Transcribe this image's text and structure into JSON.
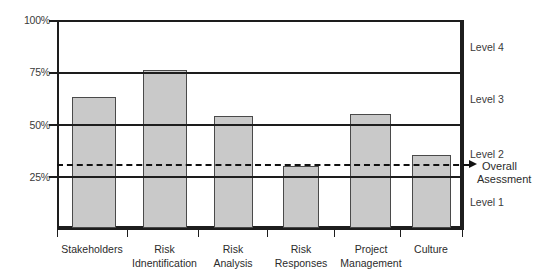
{
  "chart_data": {
    "type": "bar",
    "title": "",
    "subtitle": "",
    "xlabel": "",
    "ylabel": "",
    "ylim": [
      0,
      100
    ],
    "grid": true,
    "legend_position": "right",
    "categories": [
      "Stakeholders",
      "Risk Idnentification",
      "Risk Analysis",
      "Risk Responses",
      "Project Management",
      "Culture"
    ],
    "category_lines": [
      [
        "Stakeholders",
        ""
      ],
      [
        "Risk",
        "Idnentification"
      ],
      [
        "Risk",
        "Analysis"
      ],
      [
        "Risk",
        "Responses"
      ],
      [
        "Project",
        "Management"
      ],
      [
        "Culture",
        ""
      ]
    ],
    "values": [
      63,
      76,
      54,
      30,
      55,
      35
    ],
    "value_unit": "%",
    "ytick_labels": [
      "100%",
      "75%",
      "50%",
      "25%"
    ],
    "ytick_values": [
      100,
      75,
      50,
      25
    ],
    "gridline_values": [
      100,
      75,
      50,
      25
    ],
    "annotations": {
      "overall_assessment_value": 31,
      "overall_assessment_label_line1": "Overall",
      "overall_assessment_label_line2": "Asessment",
      "line_style": "dashed",
      "arrow": "right-arrow-marker"
    },
    "bands": [
      {
        "label": "Level 4",
        "from": 75,
        "to": 100
      },
      {
        "label": "Level 3",
        "from": 50,
        "to": 75
      },
      {
        "label": "Level 2",
        "from": 25,
        "to": 50
      },
      {
        "label": "Level 1",
        "from": 0,
        "to": 25
      }
    ],
    "colors": {
      "bar_fill": "#c9c9c9",
      "bar_stroke": "#4a4a4a",
      "axis": "#1d1d1d",
      "text": "#2b2b2b",
      "dashed_line": "#111111"
    }
  }
}
